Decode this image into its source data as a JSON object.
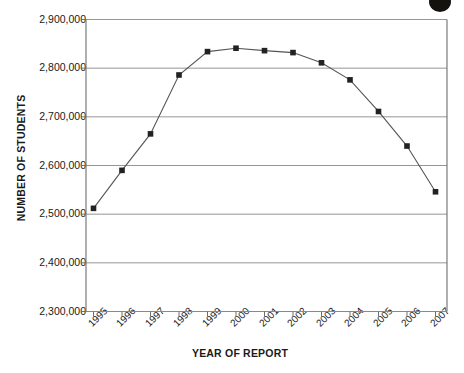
{
  "chart_data": {
    "type": "line",
    "title": "",
    "subtitle": "",
    "xlabel": "YEAR OF REPORT",
    "ylabel": "NUMBER OF STUDENTS",
    "categories": [
      "1995",
      "1996",
      "1997",
      "1998",
      "1999",
      "2000",
      "2001",
      "2002",
      "2003",
      "2004",
      "2005",
      "2006",
      "2007"
    ],
    "values": [
      2512000,
      2590000,
      2665000,
      2786000,
      2834000,
      2841000,
      2836000,
      2832000,
      2811000,
      2776000,
      2711000,
      2640000,
      2546000
    ],
    "series": [
      {
        "name": "Number of students",
        "values": [
          2512000,
          2590000,
          2665000,
          2786000,
          2834000,
          2841000,
          2836000,
          2832000,
          2811000,
          2776000,
          2711000,
          2640000,
          2546000
        ]
      }
    ],
    "ylim": [
      2300000,
      2900000
    ],
    "ytick_values": [
      2300000,
      2400000,
      2500000,
      2600000,
      2700000,
      2800000,
      2900000
    ],
    "ytick_labels": [
      "2,300,000",
      "2,400,000",
      "2,500,000",
      "2,600,000",
      "2,700,000",
      "2,800,000",
      "2,900,000"
    ],
    "xtick_labels": [
      "1995",
      "1996",
      "1997",
      "1998",
      "1999",
      "2000",
      "2001",
      "2002",
      "2003",
      "2004",
      "2005",
      "2006",
      "2007"
    ],
    "grid": "horizontal",
    "legend": "none",
    "marker": "square",
    "marker_color": "#222222",
    "line_color": "#555555",
    "gridline_color": "#8a8a8a",
    "axis_color": "#6e6e6e",
    "background_color": "#ffffff"
  },
  "artifacts": {
    "blob_label": "scan-artifact-blob"
  }
}
